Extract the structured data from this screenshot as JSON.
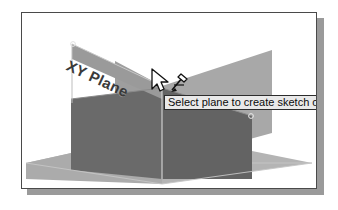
{
  "scene": {
    "title": "cad-plane-selection-viewport",
    "plane_label": "XY Plane",
    "tooltip_text": "Select plane to create sketch or",
    "cursor": "arrow-pointer-with-sketch-badge",
    "colors": {
      "background": "#ffffff",
      "frame_border": "#4a4a4a",
      "drop_shadow": "#9a9a9a",
      "plane_light": "#a8a8a8",
      "plane_mid": "#9a9a9a",
      "plane_dark": "#6a6a6a",
      "plane_darker": "#5f5f5f",
      "ground_light": "#b4b4b4",
      "edge_line": "#d8d8d8",
      "label_text": "#3a3a3a",
      "tooltip_bg": "#e9e9e9",
      "tooltip_border": "#2c2c2c",
      "tooltip_text": "#0c0c0c"
    }
  }
}
